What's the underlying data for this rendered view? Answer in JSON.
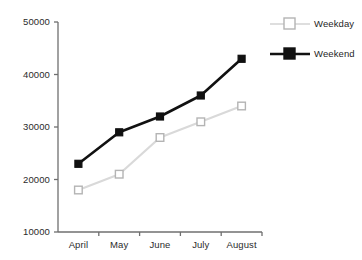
{
  "chart_data": {
    "type": "line",
    "title": "",
    "subtitle": "",
    "xlabel": "",
    "ylabel": "",
    "categories": [
      "April",
      "May",
      "June",
      "July",
      "August"
    ],
    "ylim": [
      10000,
      50000
    ],
    "yticks": [
      10000,
      20000,
      30000,
      40000,
      50000
    ],
    "ytick_labels": [
      "10000",
      "20000",
      "30000",
      "40000",
      "50000"
    ],
    "grid": false,
    "legend_position": "right",
    "series": [
      {
        "name": "Weekday",
        "color": "#d9d9d9",
        "marker": "open-square",
        "values": [
          18000,
          21000,
          28000,
          31000,
          34000
        ]
      },
      {
        "name": "Weekend",
        "color": "#111111",
        "marker": "filled-square",
        "values": [
          23000,
          29000,
          32000,
          36000,
          43000
        ]
      }
    ]
  },
  "legend": {
    "items": [
      {
        "label": "Weekday"
      },
      {
        "label": "Weekend"
      }
    ]
  },
  "axis": {
    "line_color": "#6f6f6f"
  }
}
